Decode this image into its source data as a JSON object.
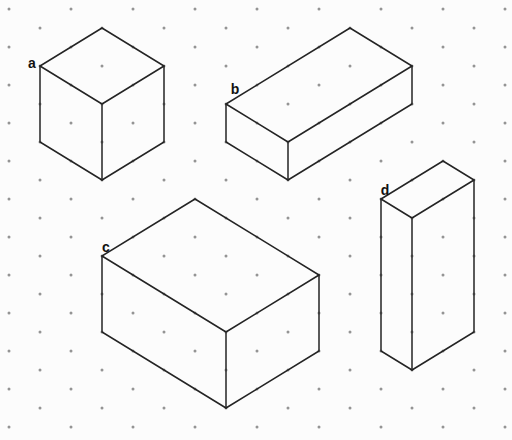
{
  "canvas": {
    "width": 512,
    "height": 440,
    "background": "#fcfcfc"
  },
  "grid": {
    "origin_x": 9,
    "origin_y": 9,
    "half_step_x": 31,
    "row_step_y": 19,
    "dot_color": "#949494",
    "dot_radius": 1.5,
    "unit_right_up": [
      31,
      -19
    ],
    "unit_right_down": [
      31,
      19
    ],
    "unit_down": [
      0,
      38
    ]
  },
  "stroke": {
    "color": "#242424",
    "width": 1.5
  },
  "label_style": {
    "color": "#111111",
    "font_size": 14
  },
  "shapes": [
    {
      "label": "a",
      "label_x": 32,
      "label_y": 68,
      "origin": [
        40,
        66
      ],
      "units_right_up": 2,
      "units_right_down": 2,
      "units_high": 2
    },
    {
      "label": "b",
      "label_x": 235,
      "label_y": 94,
      "origin": [
        226,
        104
      ],
      "units_right_up": 4,
      "units_right_down": 2,
      "units_high": 1
    },
    {
      "label": "c",
      "label_x": 106,
      "label_y": 252,
      "origin": [
        102,
        256
      ],
      "units_right_up": 3,
      "units_right_down": 4,
      "units_high": 2
    },
    {
      "label": "d",
      "label_x": 385,
      "label_y": 195,
      "origin": [
        381,
        199
      ],
      "units_right_up": 2,
      "units_right_down": 1,
      "units_high": 4
    }
  ]
}
